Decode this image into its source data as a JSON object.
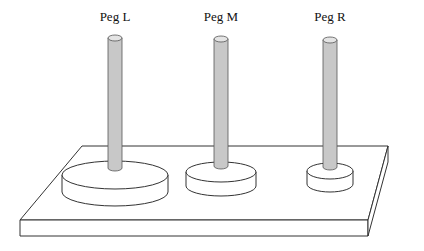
{
  "diagram": {
    "colors": {
      "background": "#ffffff",
      "stroke": "#333333",
      "peg_fill": "#c8c8c8",
      "peg_top_fill": "#e4e4e4",
      "disk_fill": "#ffffff"
    },
    "pegs": [
      {
        "id": "L",
        "label": "Peg L",
        "cx": 115,
        "top": 35,
        "label_y": 21,
        "disk": {
          "rx": 53,
          "ry": 14,
          "top_cy": 175,
          "height": 17
        }
      },
      {
        "id": "M",
        "label": "Peg M",
        "cx": 221,
        "top": 36,
        "label_y": 21,
        "disk": {
          "rx": 35,
          "ry": 10,
          "top_cy": 172,
          "height": 14
        }
      },
      {
        "id": "R",
        "label": "Peg R",
        "cx": 330,
        "top": 37,
        "label_y": 21,
        "disk": {
          "rx": 23,
          "ry": 8,
          "top_cy": 171,
          "height": 13
        }
      }
    ],
    "base": {
      "top_face": [
        [
          82,
          146
        ],
        [
          388,
          146
        ],
        [
          368,
          220
        ],
        [
          20,
          220
        ]
      ],
      "front_face": [
        [
          20,
          220
        ],
        [
          368,
          220
        ],
        [
          368,
          236
        ],
        [
          20,
          236
        ]
      ],
      "side_face": [
        [
          368,
          220
        ],
        [
          388,
          146
        ],
        [
          388,
          162
        ],
        [
          368,
          236
        ]
      ]
    }
  }
}
